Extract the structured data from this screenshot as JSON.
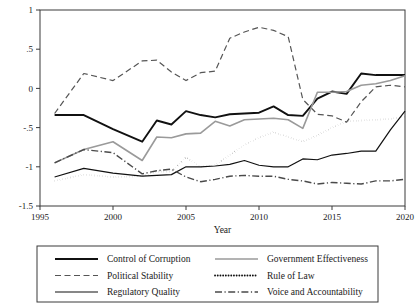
{
  "chart_data": {
    "type": "line",
    "title": "",
    "xlabel": "Year",
    "ylabel": "",
    "xlim": [
      1995,
      2020
    ],
    "ylim": [
      -1.5,
      1.0
    ],
    "grid": false,
    "legend_position": "bottom",
    "x_ticks": [
      "1995",
      "2000",
      "2005",
      "2010",
      "2015",
      "2020"
    ],
    "x_tick_values": [
      1995,
      2000,
      2005,
      2010,
      2015,
      2020
    ],
    "y_ticks": [
      "1",
      ".5",
      "0",
      "-.5",
      "-1",
      "-1.5"
    ],
    "y_tick_values": [
      1,
      0.5,
      0,
      -0.5,
      -1,
      -1.5
    ],
    "x": [
      1996,
      1998,
      2000,
      2002,
      2003,
      2004,
      2005,
      2006,
      2007,
      2008,
      2009,
      2010,
      2011,
      2012,
      2013,
      2014,
      2015,
      2016,
      2017,
      2018,
      2019,
      2020
    ],
    "series": [
      {
        "name": "Control of Corruption",
        "style": "solid",
        "color": "#111111",
        "width": 1.9,
        "values": [
          -0.34,
          -0.34,
          -0.52,
          -0.68,
          -0.41,
          -0.46,
          -0.29,
          -0.34,
          -0.37,
          -0.33,
          -0.32,
          -0.31,
          -0.23,
          -0.34,
          -0.35,
          -0.13,
          -0.04,
          -0.07,
          0.19,
          0.17,
          0.17,
          0.17
        ]
      },
      {
        "name": "Political Stability",
        "style": "dashed",
        "color": "#555555",
        "width": 1.2,
        "values": [
          -0.32,
          0.19,
          0.1,
          0.35,
          0.36,
          0.21,
          0.1,
          0.2,
          0.22,
          0.64,
          0.72,
          0.78,
          0.74,
          0.66,
          -0.14,
          -0.33,
          -0.35,
          -0.43,
          -0.17,
          0.02,
          0.04,
          0.02
        ]
      },
      {
        "name": "Regulatory Quality",
        "style": "solid",
        "color": "#111111",
        "width": 1.2,
        "values": [
          -1.13,
          -1.02,
          -1.08,
          -1.12,
          -1.11,
          -1.1,
          -1.0,
          -1.0,
          -0.99,
          -0.97,
          -0.92,
          -0.98,
          -1.0,
          -1.0,
          -0.9,
          -0.91,
          -0.85,
          -0.83,
          -0.8,
          -0.8,
          -0.53,
          -0.29
        ]
      },
      {
        "name": "Government Effectiveness",
        "style": "solid",
        "color": "#9a9a9a",
        "width": 1.6,
        "values": [
          -0.95,
          -0.78,
          -0.68,
          -0.92,
          -0.62,
          -0.63,
          -0.58,
          -0.57,
          -0.42,
          -0.48,
          -0.4,
          -0.39,
          -0.38,
          -0.4,
          -0.51,
          -0.05,
          -0.05,
          -0.04,
          0.04,
          0.06,
          0.1,
          0.16
        ]
      },
      {
        "name": "Rule of Law",
        "style": "dotted",
        "color": "#111111",
        "width": 1.8,
        "values": [
          -1.18,
          -1.1,
          -1.13,
          -1.12,
          -1.06,
          -1.06,
          -0.88,
          -1.0,
          -0.98,
          -0.85,
          -0.72,
          -0.63,
          -0.56,
          -0.62,
          -0.68,
          -0.6,
          -0.5,
          -0.42,
          -0.41,
          -0.4,
          -0.39,
          -0.36
        ]
      },
      {
        "name": "Voice and Accountability",
        "style": "dashdot",
        "color": "#4a4a4a",
        "width": 1.4,
        "values": [
          -0.95,
          -0.78,
          -0.82,
          -1.09,
          -1.05,
          -1.03,
          -1.13,
          -1.19,
          -1.16,
          -1.12,
          -1.11,
          -1.12,
          -1.12,
          -1.16,
          -1.18,
          -1.22,
          -1.2,
          -1.21,
          -1.22,
          -1.18,
          -1.18,
          -1.16
        ]
      }
    ]
  },
  "legend": {
    "entries": [
      {
        "label": "Control of Corruption",
        "series_index": 0
      },
      {
        "label": "Government Effectiveness",
        "series_index": 3
      },
      {
        "label": "Political Stability",
        "series_index": 1
      },
      {
        "label": "Rule of Law",
        "series_index": 4
      },
      {
        "label": "Regulatory Quality",
        "series_index": 2
      },
      {
        "label": "Voice and Accountability",
        "series_index": 5
      }
    ]
  },
  "axes": {
    "x_title": "Year"
  }
}
